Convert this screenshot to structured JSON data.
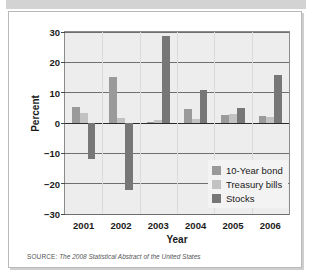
{
  "figure": {
    "source_kicker": "SOURCE:",
    "source_text": "The 2008 Statistical Abstract of the United States"
  },
  "legend": {
    "position": "inside-bottom-right",
    "items": [
      {
        "label": "10-Year bond",
        "color": "#9a9a9a",
        "swatch_name": "legend-swatch-10-year-bond"
      },
      {
        "label": "Treasury bills",
        "color": "#c2c2c2",
        "swatch_name": "legend-swatch-treasury-bills"
      },
      {
        "label": "Stocks",
        "color": "#777777",
        "swatch_name": "legend-swatch-stocks"
      }
    ]
  },
  "chart_data": {
    "type": "bar",
    "title": "",
    "xlabel": "Year",
    "ylabel": "Percent",
    "categories": [
      "2001",
      "2002",
      "2003",
      "2004",
      "2005",
      "2006"
    ],
    "series": [
      {
        "name": "10-Year bond",
        "color": "#9a9a9a",
        "values": [
          5.2,
          15.2,
          0.4,
          4.5,
          2.8,
          2.3
        ]
      },
      {
        "name": "Treasury bills",
        "color": "#c2c2c2",
        "values": [
          3.4,
          1.6,
          1.0,
          1.4,
          3.0,
          2.1
        ]
      },
      {
        "name": "Stocks",
        "color": "#777777",
        "values": [
          -11.8,
          -22.0,
          28.7,
          10.9,
          4.9,
          15.8
        ]
      }
    ],
    "ylim": [
      -30,
      30
    ],
    "yticks": [
      30,
      20,
      10,
      0,
      -10,
      -20,
      -30
    ],
    "ytick_labels": [
      "30",
      "20",
      "10",
      "0",
      "−10",
      "−20",
      "−30"
    ],
    "grid": true,
    "grid_axis": "y",
    "zero_line": true,
    "plot_background": "#ededed",
    "axis_color": "#6f6f6f"
  }
}
